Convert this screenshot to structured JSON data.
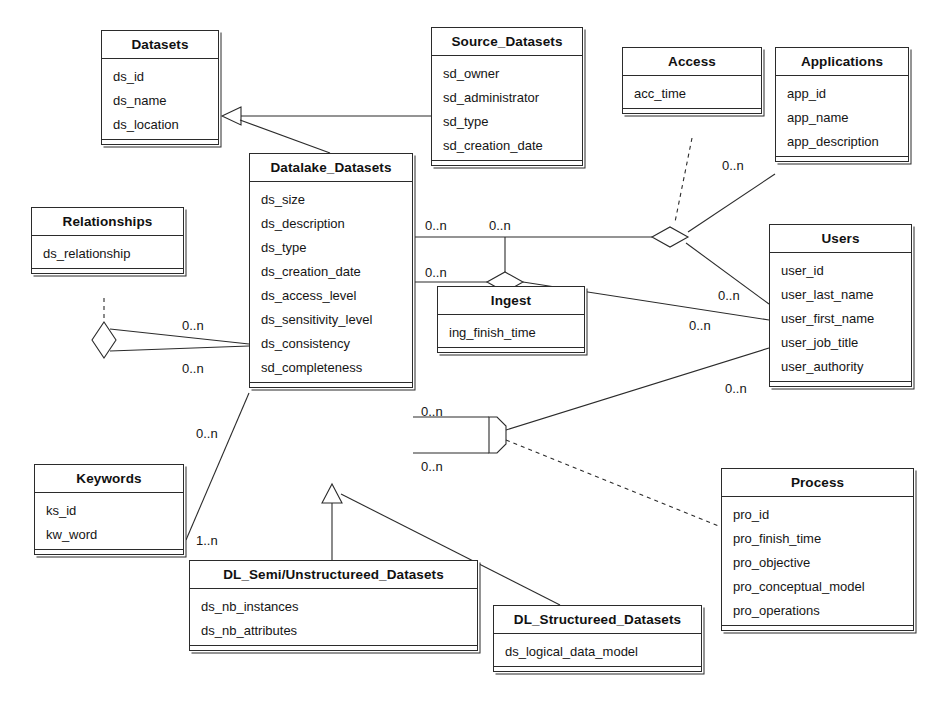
{
  "diagram": {
    "kind": "uml-class-diagram",
    "title_visible": false,
    "line_color": "#2b2b2b",
    "text_color": "#151515",
    "background": "#ffffff",
    "classes": [
      {
        "id": "datasets",
        "name": "Datasets",
        "attributes": [
          "ds_id",
          "ds_name",
          "ds_location"
        ],
        "x": 101,
        "y": 30,
        "w": 118,
        "h": 154
      },
      {
        "id": "source_datasets",
        "name": "Source_Datasets",
        "attributes": [
          "sd_owner",
          "sd_administrator",
          "sd_type",
          "sd_creation_date"
        ],
        "x": 431,
        "y": 27,
        "w": 152,
        "h": 185
      },
      {
        "id": "access",
        "name": "Access",
        "attributes": [
          "acc_time"
        ],
        "x": 622,
        "y": 47,
        "w": 140,
        "h": 91
      },
      {
        "id": "applications",
        "name": "Applications",
        "attributes": [
          "app_id",
          "app_name",
          "app_description"
        ],
        "x": 775,
        "y": 47,
        "w": 134,
        "h": 158
      },
      {
        "id": "datalake_datasets",
        "name": "Datalake_Datasets",
        "attributes": [
          "ds_size",
          "ds_description",
          "ds_type",
          "ds_creation_date",
          "ds_access_level",
          "ds_sensitivity_level",
          "ds_consistency",
          "sd_completeness"
        ],
        "x": 249,
        "y": 153,
        "w": 164,
        "h": 331
      },
      {
        "id": "relationships",
        "name": "Relationships",
        "attributes": [
          "ds_relationship"
        ],
        "x": 31,
        "y": 207,
        "w": 153,
        "h": 91
      },
      {
        "id": "users",
        "name": "Users",
        "attributes": [
          "user_id",
          "user_last_name",
          "user_first_name",
          "user_job_title",
          "user_authority"
        ],
        "x": 769,
        "y": 224,
        "w": 143,
        "h": 224
      },
      {
        "id": "ingest",
        "name": "Ingest",
        "attributes": [
          "ing_finish_time"
        ],
        "x": 437,
        "y": 286,
        "w": 148,
        "h": 92
      },
      {
        "id": "keywords",
        "name": "Keywords",
        "attributes": [
          "ks_id",
          "kw_word"
        ],
        "x": 34,
        "y": 464,
        "w": 150,
        "h": 122
      },
      {
        "id": "process",
        "name": "Process",
        "attributes": [
          "pro_id",
          "pro_finish_time",
          "pro_objective",
          "pro_conceptual_model",
          "pro_operations"
        ],
        "x": 721,
        "y": 468,
        "w": 193,
        "h": 224
      },
      {
        "id": "dl_semi_unstructured",
        "name": "DL_Semi/Unstructureed_Datasets",
        "attributes": [
          "ds_nb_instances",
          "ds_nb_attributes"
        ],
        "x": 189,
        "y": 560,
        "w": 289,
        "h": 125
      },
      {
        "id": "dl_structured",
        "name": "DL_Structureed_Datasets",
        "attributes": [
          "ds_logical_data_model"
        ],
        "x": 493,
        "y": 605,
        "w": 209,
        "h": 80
      }
    ],
    "multiplicities": [
      {
        "id": "m-apps",
        "label": "0..n",
        "x": 722,
        "y": 158
      },
      {
        "id": "m-dl-apps",
        "label": "0..n",
        "x": 425,
        "y": 218
      },
      {
        "id": "m-access-top",
        "label": "0..n",
        "x": 489,
        "y": 218
      },
      {
        "id": "m-dl-ingest",
        "label": "0..n",
        "x": 425,
        "y": 265
      },
      {
        "id": "m-users-access",
        "label": "0..n",
        "x": 718,
        "y": 288
      },
      {
        "id": "m-users-ingest",
        "label": "0..n",
        "x": 689,
        "y": 318
      },
      {
        "id": "m-rel-top",
        "label": "0..n",
        "x": 182,
        "y": 318
      },
      {
        "id": "m-rel-bottom",
        "label": "0..n",
        "x": 182,
        "y": 361
      },
      {
        "id": "m-users-proc",
        "label": "0..n",
        "x": 725,
        "y": 381
      },
      {
        "id": "m-dl-proc-top",
        "label": "0..n",
        "x": 421,
        "y": 404
      },
      {
        "id": "m-kw-top",
        "label": "0..n",
        "x": 196,
        "y": 426
      },
      {
        "id": "m-dl-proc-bottom",
        "label": "0..n",
        "x": 421,
        "y": 459
      },
      {
        "id": "m-kw-bottom",
        "label": "1..n",
        "x": 196,
        "y": 533
      }
    ]
  }
}
